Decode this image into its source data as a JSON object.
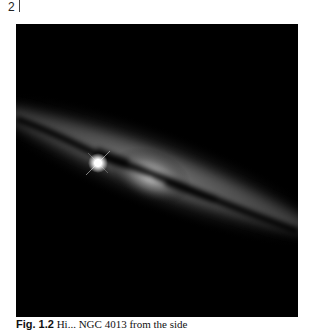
{
  "page": {
    "number": "2"
  },
  "figure": {
    "colors": {
      "background": "#000000",
      "glow": "#d8d8d8",
      "dust": "#0a0a0a",
      "star": "#ffffff"
    }
  },
  "caption": {
    "label": "Fig. 1.2",
    "text": "Hi... NGC 4013 from the side"
  }
}
